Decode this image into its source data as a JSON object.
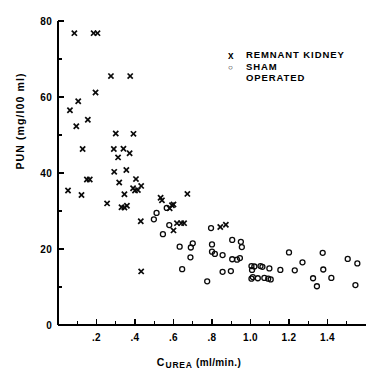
{
  "chart_data": {
    "type": "scatter",
    "title": "",
    "xlabel": "C UREA (ml/min.)",
    "xlabel_main": "C",
    "xlabel_sub": "UREA",
    "xlabel_tail": " (ml/min.)",
    "ylabel": "PUN  (mg/I00 ml)",
    "xlim": [
      0,
      1.6
    ],
    "ylim": [
      0,
      80
    ],
    "x_ticks_major": [
      0.2,
      0.4,
      0.6,
      0.8,
      1.0,
      1.2,
      1.4
    ],
    "x_ticklabels": [
      ".2",
      ".4",
      ".6",
      ".8",
      "1.0",
      "1.2",
      "1.4"
    ],
    "x_ticks_minor": [
      0.1,
      0.3,
      0.5,
      0.7,
      0.9,
      1.1,
      1.3,
      1.5
    ],
    "y_ticks_major": [
      0,
      20,
      40,
      60,
      80
    ],
    "y_ticklabels": [
      "0",
      "20",
      "40",
      "60",
      "80"
    ],
    "y_ticks_minor": [
      10,
      30,
      50,
      70
    ],
    "grid": false,
    "legend_position": "upper-right",
    "series": [
      {
        "name": "REMNANT KIDNEY",
        "marker": "x",
        "points": [
          [
            0.085,
            76.8
          ],
          [
            0.185,
            76.8
          ],
          [
            0.205,
            76.8
          ],
          [
            0.275,
            65.5
          ],
          [
            0.375,
            65.5
          ],
          [
            0.195,
            61.2
          ],
          [
            0.105,
            58.9
          ],
          [
            0.062,
            56.5
          ],
          [
            0.155,
            54.0
          ],
          [
            0.095,
            52.3
          ],
          [
            0.3,
            50.4
          ],
          [
            0.392,
            50.3
          ],
          [
            0.29,
            46.3
          ],
          [
            0.34,
            46.4
          ],
          [
            0.128,
            46.3
          ],
          [
            0.312,
            44.1
          ],
          [
            0.372,
            45.2
          ],
          [
            0.292,
            40.3
          ],
          [
            0.355,
            40.8
          ],
          [
            0.405,
            38.4
          ],
          [
            0.15,
            38.3
          ],
          [
            0.165,
            38.3
          ],
          [
            0.318,
            37.5
          ],
          [
            0.432,
            36.6
          ],
          [
            0.39,
            36.0
          ],
          [
            0.4,
            35.4
          ],
          [
            0.415,
            35.5
          ],
          [
            0.052,
            35.4
          ],
          [
            0.345,
            34.4
          ],
          [
            0.122,
            34.2
          ],
          [
            0.672,
            34.5
          ],
          [
            0.533,
            33.5
          ],
          [
            0.54,
            32.8
          ],
          [
            0.255,
            32.0
          ],
          [
            0.33,
            31.0
          ],
          [
            0.345,
            30.9
          ],
          [
            0.358,
            31.4
          ],
          [
            0.6,
            31.7
          ],
          [
            0.592,
            31.5
          ],
          [
            0.58,
            30.7
          ],
          [
            0.43,
            27.3
          ],
          [
            0.618,
            26.8
          ],
          [
            0.64,
            26.8
          ],
          [
            0.655,
            26.8
          ],
          [
            0.843,
            25.8
          ],
          [
            0.872,
            26.4
          ],
          [
            0.6,
            24.9
          ],
          [
            0.432,
            14.1
          ]
        ]
      },
      {
        "name": "SHAM OPERATED",
        "marker": "o",
        "points": [
          [
            0.565,
            30.8
          ],
          [
            0.512,
            29.5
          ],
          [
            0.498,
            27.8
          ],
          [
            0.578,
            26.3
          ],
          [
            0.545,
            23.9
          ],
          [
            0.795,
            25.5
          ],
          [
            0.905,
            22.4
          ],
          [
            0.95,
            21.9
          ],
          [
            0.632,
            20.6
          ],
          [
            0.7,
            21.5
          ],
          [
            0.8,
            21.2
          ],
          [
            0.955,
            20.5
          ],
          [
            0.69,
            20.4
          ],
          [
            1.2,
            19.1
          ],
          [
            1.375,
            19.0
          ],
          [
            0.8,
            19.3
          ],
          [
            0.815,
            18.7
          ],
          [
            0.855,
            18.4
          ],
          [
            0.688,
            17.8
          ],
          [
            1.505,
            17.4
          ],
          [
            1.27,
            16.5
          ],
          [
            1.555,
            16.2
          ],
          [
            0.905,
            17.3
          ],
          [
            0.93,
            17.2
          ],
          [
            0.945,
            17.6
          ],
          [
            1.005,
            15.5
          ],
          [
            1.02,
            15.4
          ],
          [
            1.052,
            15.5
          ],
          [
            1.062,
            15.3
          ],
          [
            1.098,
            14.9
          ],
          [
            0.645,
            14.7
          ],
          [
            0.855,
            14.0
          ],
          [
            0.898,
            14.2
          ],
          [
            1.008,
            14.5
          ],
          [
            1.155,
            14.5
          ],
          [
            1.23,
            14.4
          ],
          [
            1.378,
            14.6
          ],
          [
            1.005,
            12.2
          ],
          [
            1.012,
            12.6
          ],
          [
            1.038,
            12.3
          ],
          [
            1.072,
            12.4
          ],
          [
            1.092,
            12.2
          ],
          [
            1.105,
            12.0
          ],
          [
            1.325,
            12.3
          ],
          [
            1.42,
            12.4
          ],
          [
            0.775,
            11.5
          ],
          [
            1.345,
            10.2
          ],
          [
            1.545,
            10.5
          ]
        ]
      }
    ],
    "legend": [
      {
        "symbol": "x",
        "label": "REMNANT KIDNEY"
      },
      {
        "symbol": "o",
        "label": "SHAM\nOPERATED"
      }
    ],
    "colors": {
      "marker": "#0a0a0a",
      "axis": "#000000",
      "background": "#ffffff"
    }
  }
}
